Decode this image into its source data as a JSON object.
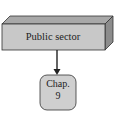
{
  "diagram": {
    "top_node": {
      "label": "Public sector",
      "fill": "#c8c8c8",
      "top_fill": "#a8a8a8",
      "side_fill": "#8c8c8c"
    },
    "bottom_node": {
      "line1": "Chap.",
      "line2": "9",
      "fill": "#cfcfcf"
    },
    "edges": [
      {
        "from": "Public sector",
        "to": "Chap. 9",
        "type": "arrow"
      }
    ]
  }
}
